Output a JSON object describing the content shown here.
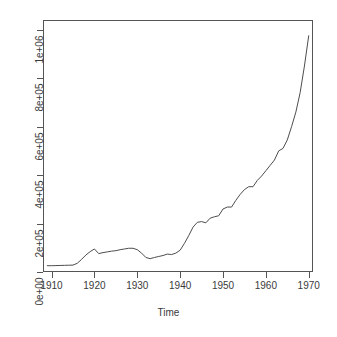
{
  "chart_data": {
    "type": "line",
    "title": "",
    "xlabel": "Time",
    "ylabel": "",
    "xlim": [
      1908,
      1971
    ],
    "ylim": [
      0,
      1040000
    ],
    "grid": false,
    "legend": false,
    "legend_position": "none",
    "x_ticks": [
      1910,
      1920,
      1930,
      1940,
      1950,
      1960,
      1970
    ],
    "x_tick_labels": [
      "1910",
      "1920",
      "1930",
      "1940",
      "1950",
      "1960",
      "1970"
    ],
    "y_ticks": [
      0,
      200000,
      400000,
      600000,
      800000,
      1000000
    ],
    "y_tick_labels": [
      "0e+00",
      "2e+05",
      "4e+05",
      "6e+05",
      "8e+05",
      "1e+06"
    ],
    "series": [
      {
        "name": "series-1",
        "color": "#4d4d4d",
        "x": [
          1909,
          1910,
          1911,
          1912,
          1913,
          1914,
          1915,
          1916,
          1917,
          1918,
          1919,
          1920,
          1921,
          1922,
          1923,
          1924,
          1925,
          1926,
          1927,
          1928,
          1929,
          1930,
          1931,
          1932,
          1933,
          1934,
          1935,
          1936,
          1937,
          1938,
          1939,
          1940,
          1941,
          1942,
          1943,
          1944,
          1945,
          1946,
          1947,
          1948,
          1949,
          1950,
          1951,
          1952,
          1953,
          1954,
          1955,
          1956,
          1957,
          1958,
          1959,
          1960,
          1961,
          1962,
          1963,
          1964,
          1965,
          1966,
          1967,
          1968,
          1969,
          1970
        ],
        "y": [
          26000,
          26000,
          26500,
          27000,
          27500,
          28000,
          28500,
          36000,
          52000,
          70000,
          84000,
          95000,
          76000,
          80000,
          83000,
          86000,
          88000,
          92000,
          95000,
          98000,
          98000,
          92000,
          78000,
          60000,
          55000,
          60000,
          64000,
          68000,
          74000,
          72000,
          78000,
          90000,
          118000,
          150000,
          185000,
          205000,
          208000,
          203000,
          222000,
          228000,
          232000,
          260000,
          268000,
          268000,
          296000,
          320000,
          340000,
          352000,
          352000,
          378000,
          396000,
          418000,
          440000,
          462000,
          500000,
          510000,
          545000,
          600000,
          660000,
          740000,
          850000,
          975000
        ]
      }
    ]
  },
  "axis": {
    "x_title": "Time"
  }
}
